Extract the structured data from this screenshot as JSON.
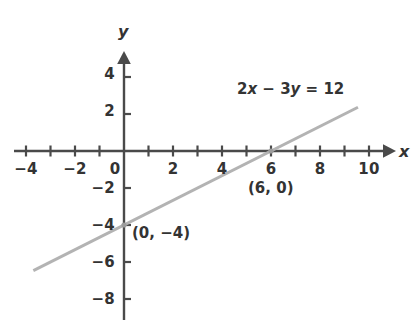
{
  "chart_data": {
    "type": "line",
    "title": "",
    "equation_label": "2x − 3y = 12",
    "equation_parts": {
      "coef_x": "2",
      "var_x": "x",
      "minus": " − ",
      "coef_y": "3",
      "var_y": "y",
      "equals": " = ",
      "rhs": "12"
    },
    "xlabel": "x",
    "ylabel": "y",
    "xlim": [
      -4.5,
      11.5
    ],
    "ylim": [
      -8.5,
      5.0
    ],
    "x_ticks": [
      -4,
      -3,
      -2,
      -1,
      0,
      1,
      2,
      3,
      4,
      5,
      6,
      7,
      8,
      9,
      10
    ],
    "x_tick_labels": [
      {
        "value": -4,
        "text": "−4"
      },
      {
        "value": -2,
        "text": "−2"
      },
      {
        "value": 0,
        "text": "0"
      },
      {
        "value": 2,
        "text": "2"
      },
      {
        "value": 4,
        "text": "4"
      },
      {
        "value": 6,
        "text": "6"
      },
      {
        "value": 8,
        "text": "8"
      },
      {
        "value": 10,
        "text": "10"
      }
    ],
    "y_ticks": [
      -8,
      -6,
      -4,
      -2,
      2,
      4
    ],
    "y_tick_labels": [
      {
        "value": 4,
        "text": "4"
      },
      {
        "value": 2,
        "text": "2"
      },
      {
        "value": -2,
        "text": "−2"
      },
      {
        "value": -4,
        "text": "−4"
      },
      {
        "value": -6,
        "text": "−6"
      },
      {
        "value": -8,
        "text": "−8"
      }
    ],
    "grid": false,
    "legend": "none",
    "series": [
      {
        "name": "2x − 3y = 12",
        "slope": 0.6666666667,
        "intercept": -4,
        "x_start": -3.7,
        "x_end": 9.55,
        "color": "#b3b3b3"
      }
    ],
    "points": [
      {
        "x": 6,
        "y": 0,
        "label": "(6, 0)",
        "marker": true
      },
      {
        "x": 0,
        "y": -4,
        "label": "(0, −4)",
        "marker": true
      }
    ],
    "annotations": [
      {
        "name": "equation-label",
        "text": "2x − 3y = 12",
        "x": 4.5,
        "y": 2.55
      },
      {
        "name": "point-label-6-0",
        "text": "(6, 0)",
        "x": 5.35,
        "y": -2.3
      },
      {
        "name": "point-label-0-neg4",
        "text": "(0, −4)",
        "x": 0.35,
        "y": -4.8
      }
    ],
    "colors": {
      "axis": "#4a4a4a",
      "line": "#b3b3b3",
      "text": "#333333",
      "background": "#ffffff"
    }
  }
}
